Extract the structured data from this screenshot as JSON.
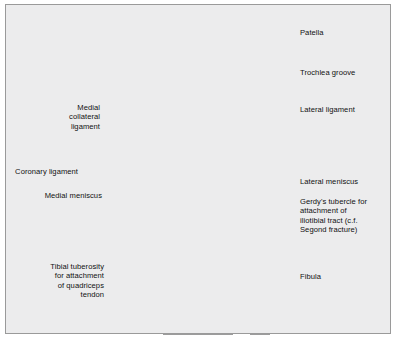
{
  "figure": {
    "background_color": "#ececed",
    "border_color": "#9a9a9a",
    "bone_fill": "#ffffff",
    "outline_color": "#3a3a3a",
    "ligament_color": "#8b8b8b",
    "ligament_dark_color": "#6f6f6f",
    "meniscus_color": "#c9c9c9",
    "cruciate_color": "#8d8d8d",
    "leader_color": "#1a1a1a"
  },
  "labels": {
    "patella": "Patella",
    "trochlea_groove": "Trochlea groove",
    "lateral_ligament": "Lateral ligament",
    "lateral_meniscus": "Lateral meniscus",
    "gerdys_tubercle": "Gerdy's tubercle for\nattachment of\niliotibial tract (c.f.\nSegond fracture)",
    "fibula": "Fibula",
    "medial_collateral_ligament": "Medial\ncollateral\nligament",
    "coronary_ligament": "Coronary ligament",
    "medial_meniscus": "Medial meniscus",
    "tibial_tuberosity": "Tibial tuberosity\nfor attachment\nof quadriceps\ntendon"
  }
}
